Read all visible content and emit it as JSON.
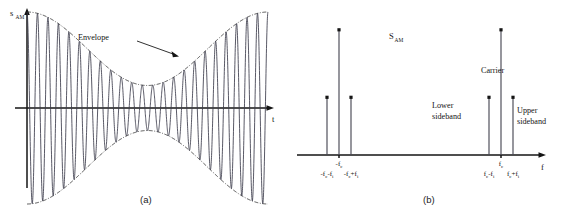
{
  "figure": {
    "background": "#ffffff",
    "ink_color": "#141414",
    "wave_color": "#3b3b4a",
    "caption_a": "(a)",
    "caption_b": "(b)"
  },
  "panel_a": {
    "name": "am-time-domain-waveform",
    "y_axis_label": "s",
    "y_axis_label_sub": "AM",
    "x_axis_label": "t",
    "annotation": {
      "text": "Envelope",
      "pointer_from_x": 137,
      "pointer_from_y": 42,
      "pointer_to_x": 176,
      "pointer_to_y": 55
    },
    "axes": {
      "origin_x": 27,
      "origin_y": 108,
      "x_end": 272,
      "y_top": 12,
      "y_bottom": 188
    }
  },
  "panel_b": {
    "name": "am-frequency-spectrum",
    "y_axis_label": "S",
    "y_axis_label_sub": "AM",
    "x_axis_label": "f",
    "axes": {
      "origin_x": 297,
      "baseline_y": 155,
      "x_end": 545,
      "y_top": 30
    },
    "annotations": [
      {
        "text_line1": "Lower",
        "text_line2": "sideband",
        "x": 432,
        "y": 108
      },
      {
        "text_line1": "Carrier",
        "text_line2": "",
        "x": 481,
        "y": 73
      },
      {
        "text_line1": "Upper",
        "text_line2": "sideband",
        "x": 517,
        "y": 113
      }
    ]
  },
  "chart_data": [
    {
      "type": "line",
      "title": "Amplitude modulated signal in the time domain",
      "xlabel": "t",
      "ylabel": "s_AM",
      "grid": false,
      "legend": "none",
      "description": "Carrier sinusoid whose amplitude is modulated by a low-frequency sinusoidal envelope; dash-dot envelope curves traced above and below.",
      "series": [
        {
          "name": "s_AM(t) = (1 + m cos(2*pi*f_i*t)) * cos(2*pi*f_c*t)",
          "carrier_cycles": 23,
          "modulation_index": 0.62,
          "envelope_cycles": 1.0,
          "envelope_phase_deg": 0,
          "carrier_amplitude": 1.0
        },
        {
          "name": "upper envelope",
          "style": "dash-dot"
        },
        {
          "name": "lower envelope",
          "style": "dash-dot"
        }
      ],
      "annotations": [
        "Envelope"
      ],
      "xlim": [
        0,
        1
      ],
      "ylim": [
        -1.62,
        1.62
      ]
    },
    {
      "type": "bar",
      "title": "Amplitude modulated signal spectrum",
      "xlabel": "f",
      "ylabel": "S_AM",
      "grid": false,
      "legend": "none",
      "description": "Two-sided AM line spectrum: carrier impulses at -f_c and f_c, with lower and upper sideband impulses at f_c -/+ f_i.",
      "categories": [
        "-f_c-f_i",
        "-f_c",
        "-f_c+f_i",
        "f_c-f_i",
        "f_c",
        "f_c+f_i"
      ],
      "values": [
        0.46,
        1.0,
        0.46,
        0.46,
        1.0,
        0.46
      ],
      "x_positions": [
        327,
        339,
        351,
        489,
        501,
        513
      ],
      "tick_labels": [
        {
          "base": "-f",
          "sub": "c",
          "base2": "-f",
          "sub2": "i",
          "x": 327,
          "text": "-f_c-f_i"
        },
        {
          "base": "-f",
          "sub": "c",
          "x": 339,
          "text": "-f_c"
        },
        {
          "base": "-f",
          "sub": "c",
          "base2": "+f",
          "sub2": "i",
          "x": 351,
          "text": "-f_c+f_i"
        },
        {
          "base": "f",
          "sub": "c",
          "base2": "-f",
          "sub2": "i",
          "x": 489,
          "text": "f_c-f_i"
        },
        {
          "base": "f",
          "sub": "c",
          "x": 501,
          "text": "f_c"
        },
        {
          "base": "f",
          "sub": "c",
          "base2": "+f",
          "sub2": "i",
          "x": 513,
          "text": "f_c+f_i"
        }
      ],
      "xlim": [
        -1,
        1
      ],
      "ylim": [
        0,
        1.1
      ]
    }
  ]
}
